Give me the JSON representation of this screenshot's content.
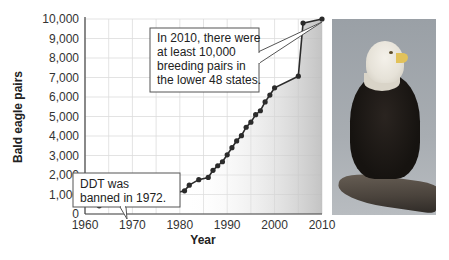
{
  "chart_data": {
    "type": "line",
    "title": "",
    "xlabel": "Year",
    "ylabel": "Bald eagle pairs",
    "xlim": [
      1960,
      2010
    ],
    "ylim": [
      0,
      10000
    ],
    "grid": true,
    "x_ticks": [
      "1960",
      "1970",
      "1980",
      "1990",
      "2000",
      "2010"
    ],
    "y_ticks": [
      "0",
      "1,000",
      "2,000",
      "3,000",
      "4,000",
      "5,000",
      "6,000",
      "7,000",
      "8,000",
      "9,000",
      "10,000"
    ],
    "x": [
      1963,
      1974,
      1981,
      1982,
      1984,
      1986,
      1987,
      1988,
      1989,
      1990,
      1991,
      1992,
      1993,
      1994,
      1995,
      1996,
      1997,
      1998,
      1999,
      2000,
      2005,
      2006,
      2010
    ],
    "series": [
      {
        "name": "Bald eagle breeding pairs",
        "values": [
          420,
          790,
          1190,
          1480,
          1760,
          1875,
          2240,
          2475,
          2680,
          3035,
          3400,
          3750,
          4015,
          4450,
          4710,
          5094,
          5295,
          5750,
          6100,
          6470,
          7066,
          9789,
          10000
        ]
      }
    ],
    "annotations": [
      {
        "text": [
          "DDT was",
          "banned in 1972."
        ],
        "x": 1972
      },
      {
        "text": [
          "In 2010, there were",
          "at least 10,000",
          "breeding pairs in",
          "the lower 48 states."
        ],
        "x": 2010
      }
    ]
  },
  "labels": {
    "xlabel": "Year",
    "ylabel": "Bald eagle pairs",
    "callout_ddt_1": "DDT was",
    "callout_ddt_2": "banned in 1972.",
    "callout_2010_1": "In 2010, there were",
    "callout_2010_2": "at least 10,000",
    "callout_2010_3": "breeding pairs in",
    "callout_2010_4": "the lower 48 states."
  },
  "colors": {
    "line": "#2b2b2b",
    "marker": "#2b2b2b",
    "grid": "#dcdcdc",
    "shade": "#c9c9c9"
  },
  "photo": {
    "subject": "bald-eagle-photo"
  }
}
